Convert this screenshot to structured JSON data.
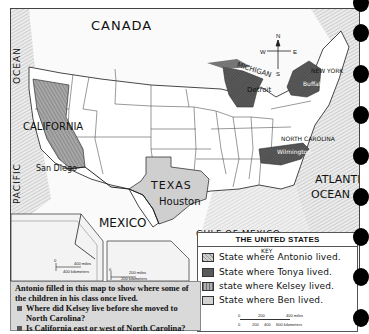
{
  "map": {
    "title": "THE UNITED STATES",
    "labels": {
      "canada": "CANADA",
      "pacific_ocean_1": "PACIFIC",
      "pacific_ocean_2": "OCEAN",
      "atlantic_ocean_1": "ATLANTIC",
      "atlantic_ocean_2": "OCEAN",
      "mexico": "MEXICO",
      "gulf_of_mexico": "GULF OF MEXICO"
    },
    "states": [
      {
        "name": "CALIFORNIA",
        "city": "San Diego",
        "kid": "Antonio"
      },
      {
        "name": "TEXAS",
        "city": "Houston",
        "kid": "Ben"
      },
      {
        "name": "MICHIGAN",
        "city": "Detroit",
        "kid": "Tonya"
      },
      {
        "name": "NEW YORK",
        "city": "Buffalo",
        "kid": "Tonya"
      },
      {
        "name": "NORTH CAROLINA",
        "city": "Wilmington",
        "kid": "Kelsey"
      }
    ],
    "compass": {
      "n": "N",
      "s": "S",
      "e": "E",
      "w": "W"
    },
    "inset_alaska_scale": {
      "miles": "400 miles",
      "km": "400 kilometers",
      "zero": "0"
    },
    "inset_hawaii_scale": {
      "miles": "200 miles",
      "km": "200 kilometers",
      "zero": "0"
    }
  },
  "legend": {
    "title": "THE UNITED STATES",
    "key_label": "KEY",
    "items": [
      {
        "label": "State where Antonio lived.",
        "swatch": "#b9b9b9",
        "pattern": "crosshatch"
      },
      {
        "label": "State where Tonya lived.",
        "swatch": "#5a5a5a",
        "pattern": "dark"
      },
      {
        "label": "state where Kelsey lived.",
        "swatch": "#8f8f8f",
        "pattern": "stripes"
      },
      {
        "label": "State where Ben lived.",
        "swatch": "#d2d2d2",
        "pattern": "light"
      }
    ],
    "scale": {
      "miles_ticks": [
        "0",
        "200",
        "400 miles"
      ],
      "km_ticks": [
        "0",
        "200",
        "400",
        "600 kilometers"
      ]
    }
  },
  "caption": {
    "intro": "Antonio filled in this map to show where some of the children in his class once lived.",
    "questions": [
      "Where did Kelsey live before she moved to North Carolina?",
      "Is California east or west of North Carolina?"
    ]
  },
  "colors": {
    "ocean_texture": "#e4e4e4",
    "state_line": "#333333",
    "caption_bg": "#d9d9d9",
    "hole": "#000000"
  }
}
